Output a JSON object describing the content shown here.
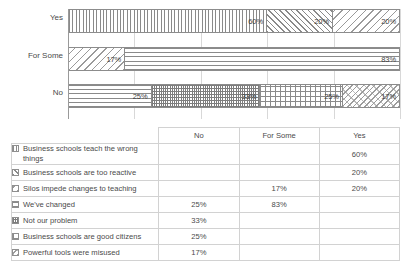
{
  "chart_data": {
    "type": "bar",
    "orientation": "horizontal",
    "stacked": true,
    "title": "",
    "xlabel": "",
    "ylabel": "",
    "grid": true,
    "legend_position": "table-below",
    "categories": [
      "Yes",
      "For Some",
      "No"
    ],
    "series": [
      {
        "name": "Business schools teach the wrong things",
        "pattern": "vertical-lines",
        "values": {
          "Yes": 60,
          "For Some": null,
          "No": null
        }
      },
      {
        "name": "Business schools are too reactive",
        "pattern": "diagonal-back-hatch",
        "values": {
          "Yes": 20,
          "For Some": null,
          "No": null
        }
      },
      {
        "name": "Silos impede changes to teaching",
        "pattern": "diagonal-forward-hatch",
        "values": {
          "Yes": 20,
          "For Some": 17,
          "No": null
        }
      },
      {
        "name": "We've changed",
        "pattern": "horizontal-lines",
        "values": {
          "Yes": null,
          "For Some": 83,
          "No": 25
        }
      },
      {
        "name": "Not our problem",
        "pattern": "fine-dots",
        "values": {
          "Yes": null,
          "For Some": null,
          "No": 33
        }
      },
      {
        "name": "Business schools are good citizens",
        "pattern": "cross-hatch-grid",
        "values": {
          "Yes": null,
          "For Some": null,
          "No": 25
        }
      },
      {
        "name": "Powerful tools were misused",
        "pattern": "diagonal-dots",
        "values": {
          "Yes": null,
          "For Some": null,
          "No": 17
        }
      }
    ],
    "bars": [
      {
        "category": "Yes",
        "segments": [
          {
            "label": "60%",
            "value": 60,
            "pattern": "vertical-lines",
            "series": "Business schools teach the wrong things"
          },
          {
            "label": "20%",
            "value": 20,
            "pattern": "diagonal-back-hatch",
            "series": "Business schools are too reactive"
          },
          {
            "label": "20%",
            "value": 20,
            "pattern": "diagonal-forward-hatch",
            "series": "Silos impede changes to teaching"
          }
        ]
      },
      {
        "category": "For Some",
        "segments": [
          {
            "label": "17%",
            "value": 17,
            "pattern": "diagonal-forward-hatch",
            "series": "Silos impede changes to teaching"
          },
          {
            "label": "83%",
            "value": 83,
            "pattern": "horizontal-lines",
            "series": "We've changed"
          }
        ]
      },
      {
        "category": "No",
        "segments": [
          {
            "label": "25%",
            "value": 25,
            "pattern": "horizontal-lines",
            "series": "We've changed"
          },
          {
            "label": "33%",
            "value": 33,
            "pattern": "fine-dots",
            "series": "Not our problem"
          },
          {
            "label": "25%",
            "value": 25,
            "pattern": "cross-hatch-grid",
            "series": "Business schools are good citizens"
          },
          {
            "label": "17%",
            "value": 17,
            "pattern": "diagonal-dots",
            "series": "Powerful tools were misused"
          }
        ]
      }
    ],
    "xlim": [
      0,
      100
    ],
    "gridline_values": [
      20,
      40,
      60,
      80,
      100
    ]
  },
  "axis": {
    "categories": [
      "Yes",
      "For Some",
      "No"
    ]
  },
  "table": {
    "headers": [
      "",
      "No",
      "For Some",
      "Yes"
    ],
    "rows": [
      {
        "swatch": "vertical-lines",
        "label": "Business schools teach the wrong things",
        "no": "",
        "for_some": "",
        "yes": "60%"
      },
      {
        "swatch": "diagonal-back-hatch",
        "label": "Business schools are too reactive",
        "no": "",
        "for_some": "",
        "yes": "20%"
      },
      {
        "swatch": "diagonal-forward-hatch",
        "label": "Silos impede changes to teaching",
        "no": "",
        "for_some": "17%",
        "yes": "20%"
      },
      {
        "swatch": "horizontal-lines",
        "label": "We've changed",
        "no": "25%",
        "for_some": "83%",
        "yes": ""
      },
      {
        "swatch": "fine-dots",
        "label": "Not our problem",
        "no": "33%",
        "for_some": "",
        "yes": ""
      },
      {
        "swatch": "cross-hatch-grid",
        "label": "Business schools are good citizens",
        "no": "25%",
        "for_some": "",
        "yes": ""
      },
      {
        "swatch": "diagonal-dots",
        "label": "Powerful tools were misused",
        "no": "17%",
        "for_some": "",
        "yes": ""
      }
    ]
  },
  "colors": {
    "background": "#ffffff",
    "text": "#4a4a4a",
    "gridline": "#d8d8d8",
    "border": "#8c8c8c",
    "table_border": "#d2d2d2",
    "pattern_ink": "#8a8a8a"
  }
}
